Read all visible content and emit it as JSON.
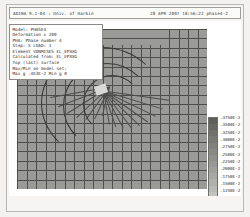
{
  "window": {
    "header_left": "ADINA 9.1-04 : Univ. of Harbin",
    "header_right": "28 APR 2007 18:56:22 phase4-2"
  },
  "info_block": {
    "lines": [
      "Model: PHASE4",
      "Deformation x 200",
      "PHA: Phase number 4",
      "Step: 5  LOAD: 1",
      "Element VONMISES EL_EPXXG",
      "Calculated from: EL_EPXXG",
      "Top (last) surface",
      "Max/Min on model set:",
      "Max g .4E3E-2  Min g 0"
    ]
  },
  "legend": {
    "title": "EL_EPXXG",
    "labels": [
      ".3750E-2",
      ".3500E-2",
      ".3250E-2",
      ".3000E-2",
      ".2750E-2",
      ".2500E-2",
      ".2250E-2",
      ".2000E-2",
      ".1750E-2",
      ".1500E-2",
      ".1250E-2",
      ".1000E-2",
      ".7500E-3",
      ".3750E-3"
    ],
    "band_colors": [
      "#5f5f5c",
      "#686865",
      "#70706d",
      "#787875",
      "#80807d",
      "#888885",
      "#90908d",
      "#989895",
      "#a0a09d",
      "#a8a8a5",
      "#b0b0ad",
      "#b8b8b5",
      "#c2c2bf",
      "#cccccA"
    ]
  },
  "plot": {
    "type": "fe-mesh-contour",
    "description": "Deformed finite element quadrilateral mesh with band plot shading",
    "mesh_fill": "#9a9a98",
    "mesh_line": "#4e4e4c",
    "background": "#ffffff"
  }
}
